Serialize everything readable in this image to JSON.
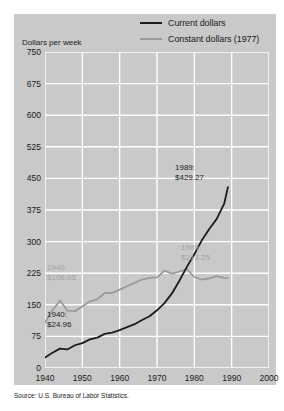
{
  "axis_title": "Dollars per week",
  "source": "Source: U.S. Bureau of Labor Statistics.",
  "legend": [
    {
      "label": "Current dollars",
      "color": "#1c1c1c",
      "key": "current"
    },
    {
      "label": "Constant dollars (1977)",
      "color": "#9a9a9a",
      "key": "constant"
    }
  ],
  "annotations": [
    {
      "name": "annotation-current-1989",
      "line1": "1989:",
      "line2": "$429.27",
      "style": "dark",
      "left": 175,
      "top": 163
    },
    {
      "name": "annotation-constant-1989",
      "line1": "1989:",
      "line2": "$213.25",
      "style": "light",
      "left": 181,
      "top": 243
    },
    {
      "name": "annotation-constant-1940",
      "line1": "1940:",
      "line2": "$108.05",
      "style": "light",
      "left": 47,
      "top": 263
    },
    {
      "name": "annotation-current-1940",
      "line1": "1940:",
      "line2": "$24.96",
      "style": "dark",
      "left": 47,
      "top": 310
    }
  ],
  "chart_data": {
    "type": "line",
    "title": "",
    "xlabel": "",
    "ylabel": "Dollars per week",
    "xlim": [
      1940,
      2000
    ],
    "ylim": [
      0,
      750
    ],
    "xticks": [
      1940,
      1950,
      1960,
      1970,
      1980,
      1990,
      2000
    ],
    "yticks": [
      0,
      75,
      150,
      225,
      300,
      375,
      450,
      525,
      600,
      675,
      750
    ],
    "grid": true,
    "legend_position": "top-right",
    "series": [
      {
        "name": "Current dollars",
        "color": "#1c1c1c",
        "x": [
          1940,
          1942,
          1944,
          1946,
          1948,
          1950,
          1952,
          1954,
          1956,
          1958,
          1960,
          1962,
          1964,
          1966,
          1968,
          1970,
          1972,
          1974,
          1976,
          1978,
          1980,
          1982,
          1984,
          1986,
          1988,
          1989
        ],
        "values": [
          24.96,
          36,
          46,
          44,
          54,
          59,
          68,
          72,
          81,
          84,
          90,
          97,
          104,
          114,
          123,
          137,
          154,
          177,
          207,
          240,
          270,
          303,
          330,
          354,
          390,
          429.27
        ]
      },
      {
        "name": "Constant dollars (1977)",
        "color": "#9a9a9a",
        "x": [
          1940,
          1942,
          1944,
          1946,
          1948,
          1950,
          1952,
          1954,
          1956,
          1958,
          1960,
          1962,
          1964,
          1966,
          1968,
          1970,
          1972,
          1974,
          1976,
          1978,
          1980,
          1982,
          1984,
          1986,
          1988,
          1989
        ],
        "values": [
          108.05,
          137,
          160,
          136,
          135,
          146,
          158,
          163,
          178,
          178,
          186,
          194,
          202,
          210,
          214,
          215,
          231,
          224,
          229,
          235,
          216,
          210,
          213,
          218,
          214,
          213.25
        ]
      }
    ]
  }
}
